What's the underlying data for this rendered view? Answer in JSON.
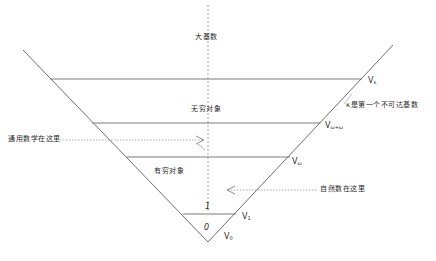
{
  "diagram": {
    "type": "von Neumann universe hierarchy (inverted cone)",
    "regions": [
      {
        "id": "large-cardinals",
        "label": "大基数"
      },
      {
        "id": "infinite-objects",
        "label": "无穷对象"
      },
      {
        "id": "finite-objects",
        "label": "有穷对象"
      },
      {
        "id": "one",
        "label": "1"
      },
      {
        "id": "zero",
        "label": "0"
      }
    ],
    "levels": [
      {
        "id": "V_kappa",
        "base": "V",
        "sub": "κ"
      },
      {
        "id": "V_omega_plus_omega",
        "base": "V",
        "sub": "ω+ω"
      },
      {
        "id": "V_omega",
        "base": "V",
        "sub": "ω"
      },
      {
        "id": "V_1",
        "base": "V",
        "sub": "1"
      },
      {
        "id": "V_0",
        "base": "V",
        "sub": "0"
      }
    ],
    "annotations": {
      "kappa_note": "κ是第一个不可达基数",
      "general_math": "通用数学在这里",
      "natural_numbers": "自然数在这里"
    },
    "colors": {
      "line": "#6e6e6e",
      "dash": "#8a8a8a",
      "text": "#2a2a2a"
    }
  }
}
